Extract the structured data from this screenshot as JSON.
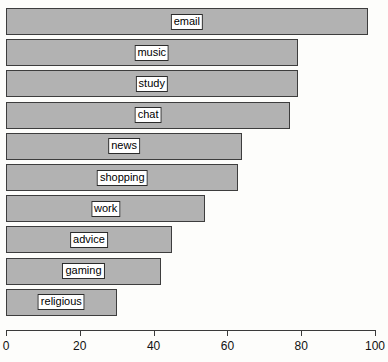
{
  "chart_data": {
    "type": "bar",
    "orientation": "horizontal",
    "title": "",
    "subtitle": "",
    "xlabel": "",
    "ylabel": "",
    "categories": [
      "email",
      "music",
      "study",
      "chat",
      "news",
      "shopping",
      "work",
      "advice",
      "gaming",
      "religious"
    ],
    "values": [
      98,
      79,
      79,
      77,
      64,
      63,
      54,
      45,
      42,
      30
    ],
    "xlim": [
      0,
      100
    ],
    "xticks": [
      0,
      20,
      40,
      60,
      80,
      100
    ],
    "xtick_labels": [
      "0",
      "20",
      "40",
      "60",
      "80",
      "100"
    ],
    "grid": false,
    "legend": null,
    "annotations": "Each bar carries its category name in a boxed white label centered on the bar.",
    "colors": {
      "bar_fill": "#b2b2b2",
      "bar_border": "#3d3d3d",
      "label_box_fill": "#ffffff",
      "label_box_border": "#2b2b2b",
      "text": "#000000",
      "axis": "#3a3a3a",
      "background": "#fdfdfb"
    }
  },
  "bars": [
    {
      "label": "email",
      "value": 98
    },
    {
      "label": "music",
      "value": 79
    },
    {
      "label": "study",
      "value": 79
    },
    {
      "label": "chat",
      "value": 77
    },
    {
      "label": "news",
      "value": 64
    },
    {
      "label": "shopping",
      "value": 63
    },
    {
      "label": "work",
      "value": 54
    },
    {
      "label": "advice",
      "value": 45
    },
    {
      "label": "gaming",
      "value": 42
    },
    {
      "label": "religious",
      "value": 30
    }
  ],
  "axis": {
    "ticks": [
      {
        "label": "0",
        "value": 0
      },
      {
        "label": "20",
        "value": 20
      },
      {
        "label": "40",
        "value": 40
      },
      {
        "label": "60",
        "value": 60
      },
      {
        "label": "80",
        "value": 80
      },
      {
        "label": "100",
        "value": 100
      }
    ]
  }
}
